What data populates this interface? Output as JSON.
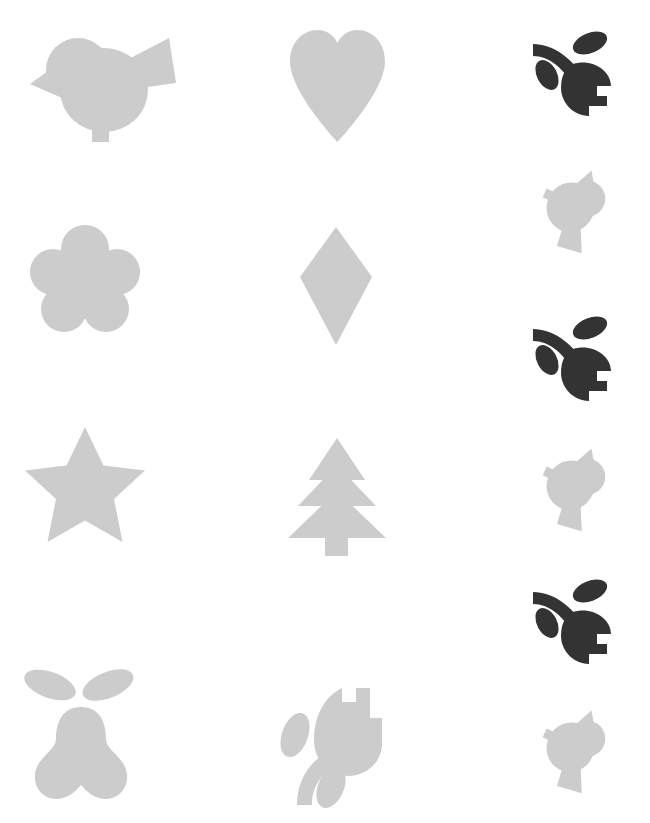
{
  "canvas": {
    "width": 650,
    "height": 823,
    "background": "#ffffff",
    "description": "Grid of decorative silhouette clip-art icons on a plain white sheet"
  },
  "palette": {
    "light_gray": "#cccccc",
    "dark_gray": "#333333"
  },
  "columns": [
    {
      "label": "column-1",
      "x_center": 85
    },
    {
      "label": "column-2",
      "x_center": 337
    },
    {
      "label": "column-3",
      "x_center": 573
    }
  ],
  "rows": [
    {
      "label": "row-1",
      "y_center": 85
    },
    {
      "label": "row-2",
      "y_center": 277
    },
    {
      "label": "row-3",
      "y_center": 490
    },
    {
      "label": "row-4",
      "y_center": 735
    }
  ],
  "shapes": [
    {
      "id": "bird-1",
      "icon": "bird-icon",
      "name": "Bird",
      "color": "#cccccc",
      "column": "column-1",
      "row": "row-1",
      "x": 22,
      "y": 28,
      "w": 155,
      "h": 115,
      "rotation": 0
    },
    {
      "id": "heart-1",
      "icon": "heart-icon",
      "name": "Heart",
      "color": "#cccccc",
      "column": "column-2",
      "row": "row-1",
      "x": 290,
      "y": 30,
      "w": 95,
      "h": 112,
      "rotation": 0
    },
    {
      "id": "tulip-dark-1",
      "icon": "tulip-flower-icon",
      "name": "Tulip with stem and leaves",
      "color": "#333333",
      "column": "column-3",
      "row": "row-1",
      "x": 531,
      "y": 30,
      "w": 84,
      "h": 88,
      "rotation": 0
    },
    {
      "id": "blossom-1",
      "icon": "five-petal-blossom-icon",
      "name": "Five petal blossom flower",
      "color": "#cccccc",
      "column": "column-1",
      "row": "row-2",
      "x": 30,
      "y": 225,
      "w": 110,
      "h": 108,
      "rotation": 0
    },
    {
      "id": "diamond-1",
      "icon": "diamond-icon",
      "name": "Diamond rhombus",
      "color": "#cccccc",
      "column": "column-2",
      "row": "row-2",
      "x": 300,
      "y": 227,
      "w": 72,
      "h": 118,
      "rotation": 0
    },
    {
      "id": "bird-rotated-1",
      "icon": "bird-icon",
      "name": "Bird rotated",
      "color": "#cccccc",
      "column": "column-3",
      "row": "row-2",
      "x": 530,
      "y": 160,
      "w": 88,
      "h": 92,
      "rotation": 115
    },
    {
      "id": "tulip-dark-2",
      "icon": "tulip-flower-icon",
      "name": "Tulip with stem and leaves",
      "color": "#333333",
      "column": "column-3",
      "row": "row-2-b",
      "x": 531,
      "y": 315,
      "w": 84,
      "h": 88,
      "rotation": 0
    },
    {
      "id": "star-1",
      "icon": "star-icon",
      "name": "Five pointed star",
      "color": "#cccccc",
      "column": "column-1",
      "row": "row-3",
      "x": 25,
      "y": 427,
      "w": 120,
      "h": 115,
      "rotation": 0
    },
    {
      "id": "tree-1",
      "icon": "fir-tree-icon",
      "name": "Fir / Christmas tree",
      "color": "#cccccc",
      "column": "column-2",
      "row": "row-3",
      "x": 288,
      "y": 438,
      "w": 98,
      "h": 118,
      "rotation": 0
    },
    {
      "id": "bird-rotated-2",
      "icon": "bird-icon",
      "name": "Bird rotated",
      "color": "#cccccc",
      "column": "column-3",
      "row": "row-3",
      "x": 530,
      "y": 438,
      "w": 88,
      "h": 92,
      "rotation": 115
    },
    {
      "id": "tulip-dark-3",
      "icon": "tulip-flower-icon",
      "name": "Tulip with stem and leaves",
      "color": "#333333",
      "column": "column-3",
      "row": "row-3-b",
      "x": 531,
      "y": 578,
      "w": 84,
      "h": 88,
      "rotation": 0
    },
    {
      "id": "pear-1",
      "icon": "pear-with-leaves-icon",
      "name": "Pear with two leaves",
      "color": "#cccccc",
      "column": "column-1",
      "row": "row-4",
      "x": 22,
      "y": 663,
      "w": 118,
      "h": 140,
      "rotation": 0
    },
    {
      "id": "tulip-light-1",
      "icon": "tulip-flower-icon",
      "name": "Tulip with stem and leaves",
      "color": "#cccccc",
      "column": "column-2",
      "row": "row-4",
      "x": 276,
      "y": 688,
      "w": 110,
      "h": 117,
      "rotation": 0
    },
    {
      "id": "bird-rotated-3",
      "icon": "bird-icon",
      "name": "Bird rotated",
      "color": "#cccccc",
      "column": "column-3",
      "row": "row-4",
      "x": 530,
      "y": 700,
      "w": 88,
      "h": 92,
      "rotation": 115
    }
  ]
}
